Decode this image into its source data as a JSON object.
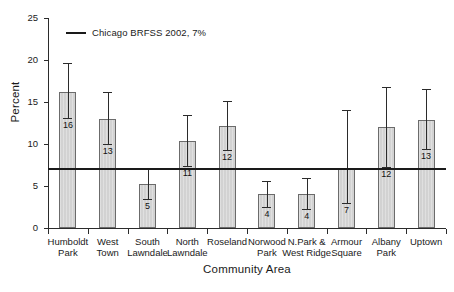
{
  "chart_data": {
    "type": "bar",
    "title": "",
    "xlabel": "Community Area",
    "ylabel": "Percent",
    "ylim": [
      0,
      25
    ],
    "yticks": [
      0,
      5,
      10,
      15,
      20,
      25
    ],
    "ytick_labels": [
      "0",
      "5",
      "10",
      "15",
      "20",
      "25"
    ],
    "grid": false,
    "legend_position": "top-left-inside",
    "legend": [
      {
        "label": "Chicago BRFSS 2002, 7%",
        "marker": "line",
        "color": "#1a1a1a"
      }
    ],
    "reference_line": {
      "value": 7,
      "label": "Chicago BRFSS 2002, 7%",
      "color": "#1a1a1a"
    },
    "categories": [
      "Humboldt Park",
      "West Town",
      "South Lawndale",
      "North Lawndale",
      "Roseland",
      "Norwood Park",
      "N.Park & West Ridge",
      "Armour Square",
      "Albany Park",
      "Uptown"
    ],
    "category_lines": [
      [
        "Humboldt",
        "Park"
      ],
      [
        "West",
        "Town"
      ],
      [
        "South",
        "Lawndale"
      ],
      [
        "North",
        "Lawndale"
      ],
      [
        "Roseland"
      ],
      [
        "Norwood",
        "Park"
      ],
      [
        "N.Park &",
        "West Ridge"
      ],
      [
        "Armour",
        "Square"
      ],
      [
        "Albany",
        "Park"
      ],
      [
        "Uptown"
      ]
    ],
    "values": [
      16.2,
      13.0,
      5.2,
      10.4,
      12.1,
      4.0,
      4.0,
      7.0,
      12.0,
      12.9
    ],
    "data_labels": [
      "16",
      "13",
      "5",
      "11",
      "12",
      "4",
      "4",
      "7",
      "12",
      "13"
    ],
    "error_high": [
      19.6,
      16.2,
      7.0,
      13.4,
      15.1,
      5.6,
      5.9,
      14.0,
      16.8,
      16.6
    ],
    "error_low": [
      13.1,
      10.0,
      3.5,
      7.4,
      9.3,
      2.5,
      2.3,
      3.0,
      7.3,
      9.4
    ],
    "bar_color": "#d2d2d2",
    "bar_edge_color": "#6b6b6b"
  }
}
